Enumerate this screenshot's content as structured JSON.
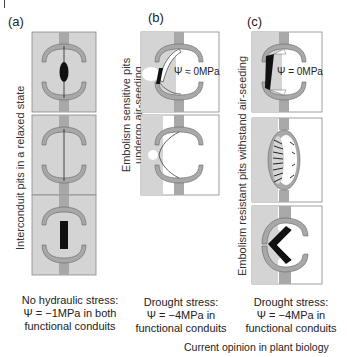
{
  "figure": {
    "panels": [
      {
        "id": "a",
        "label": "(a)",
        "side_label": "Interconduit pits in a relaxed state",
        "caption_lines": [
          "No hydraulic stress:",
          "Ψ = −1MPa in both",
          "functional conduits"
        ]
      },
      {
        "id": "b",
        "label": "(b)",
        "side_label_lines": [
          "Embolism sensitive pits",
          "undergo air-seeding"
        ],
        "psi_label": "Ψ ≈ 0MPa",
        "caption_lines": [
          "Drought stress:",
          "Ψ = −4MPa in",
          "functional conduits"
        ]
      },
      {
        "id": "c",
        "label": "(c)",
        "side_label": "Embolism resistant pits withstand air-seeding",
        "psi_label": "Ψ = 0MPa",
        "caption_lines": [
          "Drought stress:",
          "Ψ = −4MPa in",
          "functional conduits"
        ]
      }
    ],
    "credit": "Current opinion in plant biology",
    "colors": {
      "conduit_fill": "#d4d4d4",
      "wall_fill": "#a8a8a8",
      "torus_black": "#111111",
      "embolized_white": "#ffffff",
      "box_border": "#888888"
    }
  }
}
